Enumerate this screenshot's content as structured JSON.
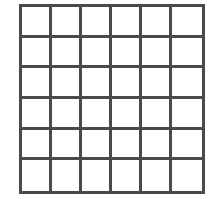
{
  "grid": {
    "rows": 6,
    "columns": 6,
    "line_color": "#4a4a4a",
    "cell_fill": "#ffffff",
    "cells": [
      [
        "",
        "",
        "",
        "",
        "",
        ""
      ],
      [
        "",
        "",
        "",
        "",
        "",
        ""
      ],
      [
        "",
        "",
        "",
        "",
        "",
        ""
      ],
      [
        "",
        "",
        "",
        "",
        "",
        ""
      ],
      [
        "",
        "",
        "",
        "",
        "",
        ""
      ],
      [
        "",
        "",
        "",
        "",
        "",
        ""
      ]
    ]
  }
}
